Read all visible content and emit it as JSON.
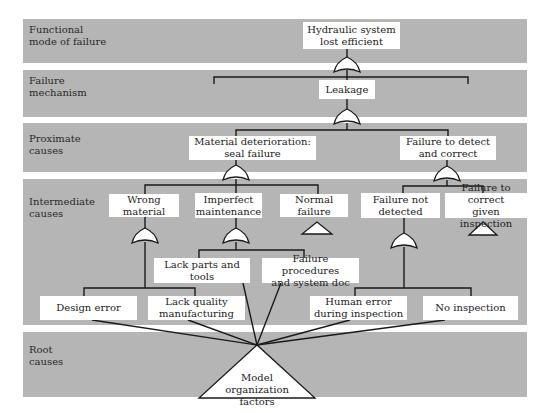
{
  "diagram": {
    "type": "fault-tree",
    "bands": [
      {
        "label_line1": "Functional",
        "label_line2": "mode of failure"
      },
      {
        "label_line1": "Failure",
        "label_line2": "mechanism"
      },
      {
        "label_line1": "Proximate",
        "label_line2": "causes"
      },
      {
        "label_line1": "Intermediate",
        "label_line2": "causes"
      },
      {
        "label_line1": "Root",
        "label_line2": "causes"
      }
    ],
    "nodes": {
      "top_event": {
        "line1": "Hydraulic system",
        "line2": "lost efficient"
      },
      "leakage": {
        "line1": "Leakage"
      },
      "material_deterioration": {
        "line1": "Material deterioration:",
        "line2": "seal failure"
      },
      "failure_to_detect": {
        "line1": "Failure to detect",
        "line2": "and correct"
      },
      "wrong_material": {
        "line1": "Wrong material"
      },
      "imperfect_maintenance": {
        "line1": "Imperfect",
        "line2": "maintenance"
      },
      "normal_failure": {
        "line1": "Normal failure"
      },
      "failure_not_detected": {
        "line1": "Failure not",
        "line2": "detected"
      },
      "failure_to_correct": {
        "line1": "Failure to correct",
        "line2": "given inspection"
      },
      "lack_parts": {
        "line1": "Lack parts and tools"
      },
      "failure_procedures": {
        "line1": "Failure procedures",
        "line2": "and system doc"
      },
      "design_error": {
        "line1": "Design error"
      },
      "lack_quality": {
        "line1": "Lack quality",
        "line2": "manufacturing"
      },
      "human_error": {
        "line1": "Human error",
        "line2": "during inspection"
      },
      "no_inspection": {
        "line1": "No inspection"
      },
      "root": {
        "line1": "Model",
        "line2": "organization factors"
      }
    },
    "colors": {
      "band": "#b5b5b5",
      "box": "#ffffff",
      "line": "#1a1a1a"
    }
  }
}
